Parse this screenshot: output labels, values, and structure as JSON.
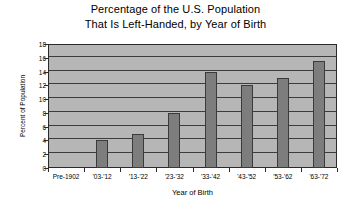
{
  "chart_data": {
    "type": "bar",
    "title": "Percentage of the U.S. Population That Is Left-Handed, by Year of Birth",
    "title_lines": [
      "Percentage of the U.S. Population",
      "That Is Left-Handed, by Year of Birth"
    ],
    "xlabel": "Year of Birth",
    "ylabel": "Percent of Population",
    "categories": [
      "Pre-1902",
      "'03-'12",
      "'13-'22",
      "'23-'32",
      "'33-'42",
      "'43-'52",
      "'53-'62",
      "'63-'72"
    ],
    "values": [
      0,
      4,
      5,
      8,
      14,
      12,
      13,
      15.5
    ],
    "ylim": [
      0,
      18
    ],
    "ytick_labels": [
      "0",
      "2",
      "4",
      "6",
      "8",
      "10",
      "12",
      "14",
      "16",
      "18"
    ],
    "ytick_values": [
      0,
      2,
      4,
      6,
      8,
      10,
      12,
      14,
      16,
      18
    ],
    "grid": true,
    "legend": false,
    "colors": {
      "bar_fill": "#7d7d7d",
      "bar_edge": "#3a3a3a",
      "plot_background": "#b6b6b6",
      "gridline": "#3b3b3b",
      "axis": "#2a2a2a",
      "page_background": "#ffffff",
      "text": "#000000"
    }
  }
}
